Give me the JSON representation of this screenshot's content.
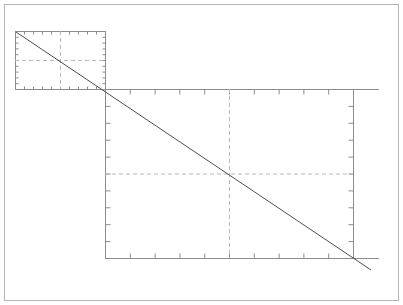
{
  "figure": {
    "title": "",
    "background_color": "#ffffff",
    "border_color": "#b0b0b0",
    "axis_color": "#8c8c8c",
    "grid_color": "#b8b8b8",
    "line_color": "#4d4d4d",
    "width": 403,
    "height": 305
  },
  "chart_data": {
    "type": "line",
    "title": "",
    "subtitle": "",
    "xlabel": "",
    "ylabel": "",
    "legend": [],
    "annotations": [],
    "grid": "dashed-crosshair-only",
    "legend_position": "none",
    "panels": [
      {
        "name": "inset-panel",
        "role": "inset",
        "frame_px": {
          "x": 15,
          "y": 31,
          "width": 90,
          "height": 58
        },
        "xlim": [
          0,
          10
        ],
        "ylim": [
          0,
          10
        ],
        "xticks": [
          0,
          1,
          2,
          3,
          4,
          5,
          6,
          7,
          8,
          9,
          10
        ],
        "yticks": [
          0,
          1,
          2,
          3,
          4,
          5,
          6,
          7,
          8,
          9,
          10
        ],
        "xticklabels": [],
        "yticklabels": [],
        "tick_direction": "in",
        "crosshair": {
          "x": 5,
          "y": 5
        },
        "series": [
          {
            "name": "diagonal",
            "style": "solid",
            "x": [
              0,
              10
            ],
            "y": [
              10,
              0
            ]
          }
        ]
      },
      {
        "name": "main-panel",
        "role": "main",
        "frame_px": {
          "x": 105,
          "y": 89,
          "width": 248,
          "height": 169
        },
        "xlim": [
          0,
          10
        ],
        "ylim": [
          0,
          10
        ],
        "xticks": [
          0,
          1,
          2,
          3,
          4,
          5,
          6,
          7,
          8,
          9,
          10
        ],
        "yticks": [
          0,
          1,
          2,
          3,
          4,
          5,
          6,
          7,
          8,
          9,
          10
        ],
        "xticklabels": [],
        "yticklabels": [],
        "tick_direction": "in",
        "crosshair": {
          "x": 5,
          "y": 5
        },
        "series": [
          {
            "name": "diagonal",
            "style": "solid",
            "x": [
              0,
              10
            ],
            "y": [
              10,
              0
            ]
          }
        ]
      }
    ],
    "overlay_line": {
      "name": "continuous-diagonal",
      "style": "solid",
      "points_px": [
        {
          "x": 16,
          "y": 32
        },
        {
          "x": 371,
          "y": 270
        }
      ]
    },
    "extension_rules_px": [
      {
        "name": "top-rule-extension",
        "x1": 353,
        "y1": 89,
        "x2": 379,
        "y2": 89
      },
      {
        "name": "bottom-rule-extension",
        "x1": 353,
        "y1": 258,
        "x2": 379,
        "y2": 258
      }
    ]
  }
}
